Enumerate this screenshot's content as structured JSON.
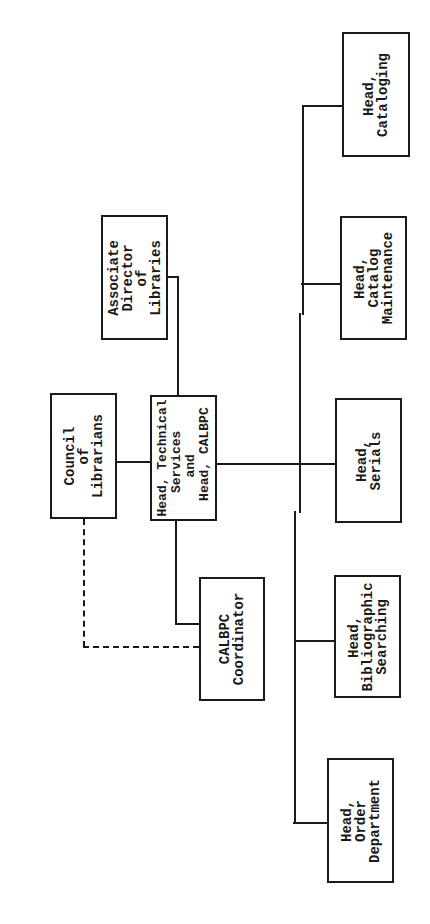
{
  "diagram": {
    "type": "organization-chart",
    "orientation": "rotated-90-ccw",
    "nodes": {
      "associate_director": {
        "label": "Associate\nDirector\nof\nLibraries"
      },
      "council": {
        "label": "Council\nof\nLibrarians"
      },
      "head_technical": {
        "label": "Head, Technical\n   Services\n     and\n  Head, CALBPC"
      },
      "coordinator": {
        "label": "CALBPC\nCoordinator"
      },
      "cataloging": {
        "label": "Head,\nCataloging"
      },
      "catalog_maintenance": {
        "label": "Head,\nCatalog\nMaintenance"
      },
      "serials": {
        "label": "Head,\nSerials"
      },
      "bibliographic": {
        "label": "Head,\nBibliographic\nSearching"
      },
      "order": {
        "label": "Head,\nOrder\nDepartment"
      }
    },
    "edges": [
      {
        "from": "associate_director",
        "to": "head_technical",
        "style": "solid"
      },
      {
        "from": "council",
        "to": "head_technical",
        "style": "solid"
      },
      {
        "from": "head_technical",
        "to": "coordinator",
        "style": "solid"
      },
      {
        "from": "council",
        "to": "coordinator",
        "style": "dashed"
      },
      {
        "from": "head_technical",
        "to": "cataloging",
        "style": "solid"
      },
      {
        "from": "head_technical",
        "to": "catalog_maintenance",
        "style": "solid"
      },
      {
        "from": "head_technical",
        "to": "serials",
        "style": "solid"
      },
      {
        "from": "head_technical",
        "to": "bibliographic",
        "style": "solid"
      },
      {
        "from": "head_technical",
        "to": "order",
        "style": "solid"
      }
    ],
    "colors": {
      "ink": "#1a1a1a",
      "paper": "#ffffff"
    }
  }
}
